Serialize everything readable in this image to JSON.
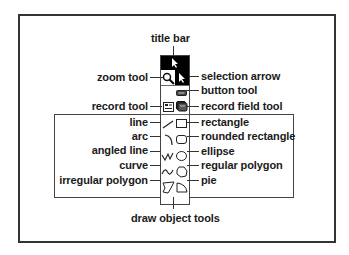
{
  "diagram": {
    "title_bar_label": "title bar",
    "group_label": "draw object tools",
    "left_labels": {
      "zoom_tool": "zoom tool",
      "record_tool": "record tool",
      "line": "line",
      "arc": "arc",
      "angled_line": "angled line",
      "curve": "curve",
      "irregular_polygon": "irregular polygon"
    },
    "right_labels": {
      "selection_arrow": "selection arrow",
      "button_tool": "button tool",
      "record_field_tool": "record field tool",
      "rectangle": "rectangle",
      "rounded_rectangle": "rounded rectangle",
      "ellipse": "ellipse",
      "regular_polygon": "regular polygon",
      "pie": "pie"
    },
    "palette_tools": [
      "title-bar",
      "zoom-tool",
      "selection-arrow",
      "button-tool",
      "record-tool",
      "record-field-tool",
      "line",
      "rectangle",
      "arc",
      "rounded-rectangle",
      "angled-line",
      "ellipse",
      "curve",
      "regular-polygon",
      "irregular-polygon",
      "pie"
    ],
    "colors": {
      "ink": "#1a1a1a",
      "title_bar": "#000000",
      "selected": "#000000"
    }
  }
}
